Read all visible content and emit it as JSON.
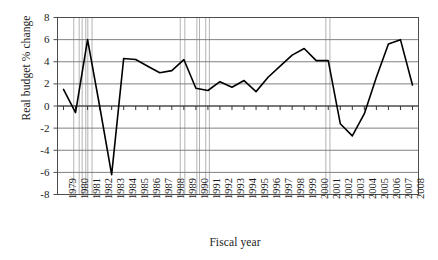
{
  "chart_data": {
    "type": "line",
    "title": "",
    "xlabel": "Fiscal year",
    "ylabel": "Real budget % change",
    "ylim": [
      -8,
      8
    ],
    "ytick_values": [
      8,
      6,
      4,
      2,
      0,
      -2,
      -4,
      -6,
      -8
    ],
    "ytick_labels": [
      "8",
      "6",
      "4",
      "2",
      "0",
      "-2",
      "-4",
      "-6",
      "-8"
    ],
    "grid": true,
    "legend": "none",
    "xlim": [
      "1979",
      "2008"
    ],
    "categories": [
      "1979",
      "1980",
      "1981",
      "1982",
      "1983",
      "1984",
      "1985",
      "1986",
      "1987",
      "1988",
      "1989",
      "1990",
      "1991",
      "1992",
      "1993",
      "1994",
      "1995",
      "1996",
      "1997",
      "1998",
      "1999",
      "2000",
      "2001",
      "2002",
      "2003",
      "2004",
      "2005",
      "2006",
      "2007",
      "2008"
    ],
    "series": [
      {
        "name": "Real budget % change",
        "values": [
          1.5,
          -0.6,
          6.0,
          0.0,
          -6.2,
          4.3,
          4.2,
          3.6,
          3.0,
          3.2,
          4.2,
          1.6,
          1.4,
          2.2,
          1.7,
          2.3,
          1.3,
          2.6,
          3.6,
          4.6,
          5.2,
          4.1,
          4.1,
          -1.6,
          -2.7,
          -0.7,
          2.6,
          5.6,
          6.0,
          1.9
        ]
      }
    ],
    "shaded_bands": [
      {
        "name": "band-1980",
        "start": "1980",
        "end": "1980"
      },
      {
        "name": "band-1981a",
        "start": "1981",
        "end": "1981"
      },
      {
        "name": "band-1981b",
        "start": "1981",
        "end": "1981"
      },
      {
        "name": "band-1989",
        "start": "1989",
        "end": "1989"
      },
      {
        "name": "band-1990",
        "start": "1990",
        "end": "1990"
      },
      {
        "name": "band-1991",
        "start": "1991",
        "end": "1991"
      },
      {
        "name": "band-2001",
        "start": "2001",
        "end": "2001"
      }
    ],
    "line_color": "#000000",
    "grid_color": "#808080",
    "axis_color": "#4d4d4d",
    "band_color": "#b3b3b3"
  }
}
